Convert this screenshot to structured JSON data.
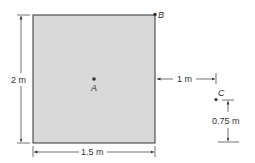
{
  "diagram": {
    "plate": {
      "fill": "#d9d9d9",
      "stroke": "#333333"
    },
    "points": {
      "A": {
        "label": "A"
      },
      "B": {
        "label": "B"
      },
      "C": {
        "label": "C"
      }
    },
    "dimensions": {
      "height": "2 m",
      "width": "1.5 m",
      "horizontal_offset": "1 m",
      "vertical_offset": "0.75 m"
    }
  }
}
